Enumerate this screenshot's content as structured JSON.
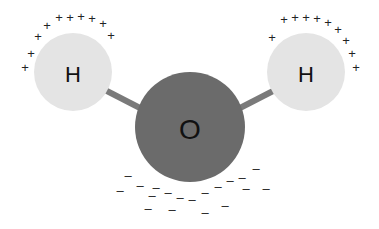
{
  "colors": {
    "hydrogen_fill": "#e4e4e4",
    "oxygen_fill": "#6b6b6b",
    "bond": "#7a7a7a",
    "charge": "#222222",
    "background": "#ffffff"
  },
  "atoms": [
    {
      "id": "h-left",
      "label": "H",
      "cx": 73,
      "cy": 72,
      "r": 39
    },
    {
      "id": "oxygen",
      "label": "O",
      "cx": 190,
      "cy": 127,
      "r": 55
    },
    {
      "id": "h-right",
      "label": "H",
      "cx": 306,
      "cy": 72,
      "r": 39
    }
  ],
  "bonds": [
    {
      "x1": 105,
      "y1": 90,
      "x2": 140,
      "y2": 108
    },
    {
      "x1": 240,
      "y1": 108,
      "x2": 275,
      "y2": 90
    }
  ],
  "positive_charges": {
    "symbol": "+",
    "left": [
      [
        59,
        17
      ],
      [
        70,
        17
      ],
      [
        81,
        16
      ],
      [
        92,
        18
      ],
      [
        103,
        23
      ],
      [
        111,
        35
      ],
      [
        47,
        25
      ],
      [
        38,
        36
      ],
      [
        31,
        53
      ],
      [
        25,
        67
      ]
    ],
    "right": [
      [
        284,
        19
      ],
      [
        295,
        17
      ],
      [
        306,
        17
      ],
      [
        317,
        18
      ],
      [
        328,
        22
      ],
      [
        272,
        37
      ],
      [
        338,
        29
      ],
      [
        346,
        40
      ],
      [
        352,
        53
      ],
      [
        356,
        67
      ]
    ]
  },
  "negative_charges": {
    "symbol": "–",
    "points": [
      [
        128,
        175
      ],
      [
        140,
        185
      ],
      [
        152,
        195
      ],
      [
        156,
        187
      ],
      [
        168,
        192
      ],
      [
        180,
        197
      ],
      [
        192,
        199
      ],
      [
        205,
        192
      ],
      [
        218,
        186
      ],
      [
        230,
        180
      ],
      [
        242,
        177
      ],
      [
        256,
        168
      ],
      [
        120,
        190
      ],
      [
        148,
        208
      ],
      [
        172,
        209
      ],
      [
        205,
        212
      ],
      [
        225,
        205
      ],
      [
        246,
        188
      ],
      [
        266,
        188
      ]
    ]
  }
}
